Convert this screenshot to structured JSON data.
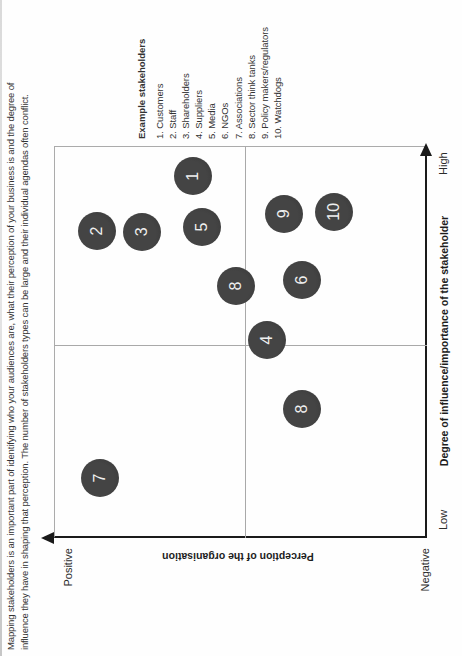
{
  "figure": {
    "caption_line1": "Mapping stakeholders is an important part of identifying who your audiences are, what their perception of your business is and the degree of",
    "caption_line2": "influence they have in shaping that perception. The number of stakeholders types can be large and their individual agendas often conflict."
  },
  "chart_data": {
    "type": "scatter",
    "rotated_90_ccw_on_page": true,
    "xlabel": "Degree of influence/importance of the stakeholder",
    "x_axis_end_labels": [
      "Low",
      "High"
    ],
    "ylabel": "Perception of the organisation",
    "y_axis_end_labels": [
      "Negative",
      "Positive"
    ],
    "x_range": [
      0,
      100
    ],
    "y_range": [
      0,
      100
    ],
    "quadrant_dividers": true,
    "legend_title": "Example stakeholders",
    "legend_items": [
      "1. Customers",
      "2. Staff",
      "3. Shareholders",
      "4. Suppliers",
      "5. Media",
      "6. NGOs",
      "7. Associations",
      "8. Sector think tanks",
      "9. Policy makers/regulators",
      "10. Watchdogs"
    ],
    "points": [
      {
        "label": "1",
        "x": 92.3,
        "y": 62.7
      },
      {
        "label": "2",
        "x": 78.3,
        "y": 88.5
      },
      {
        "label": "3",
        "x": 78.1,
        "y": 76.4
      },
      {
        "label": "4",
        "x": 50.5,
        "y": 42.9
      },
      {
        "label": "5",
        "x": 79.3,
        "y": 60.3
      },
      {
        "label": "6",
        "x": 65.8,
        "y": 33.5
      },
      {
        "label": "7",
        "x": 15.3,
        "y": 87.7
      },
      {
        "label": "8",
        "x": 64.3,
        "y": 51.2
      },
      {
        "label": "8",
        "x": 32.9,
        "y": 33.5
      },
      {
        "label": "9",
        "x": 82.7,
        "y": 38.3
      },
      {
        "label": "10",
        "x": 83.2,
        "y": 24.9
      }
    ],
    "colors": {
      "point_fill": "#3d3d3d",
      "point_text": "#efefef",
      "axis_line": "#1a1a1a",
      "grid_line": "#ababab"
    }
  }
}
